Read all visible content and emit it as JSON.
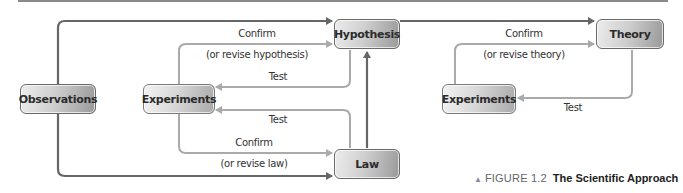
{
  "diagram": {
    "nodes": {
      "observations": "Observations",
      "experiments_left": "Experiments",
      "hypothesis": "Hypothesis",
      "law": "Law",
      "theory": "Theory",
      "experiments_right": "Experiments"
    },
    "edge_labels": {
      "confirm_hypothesis": "Confirm",
      "revise_hypothesis": "(or revise hypothesis)",
      "test_hypothesis": "Test",
      "test_law": "Test",
      "confirm_law": "Confirm",
      "revise_law": "(or revise law)",
      "confirm_theory": "Confirm",
      "revise_theory": "(or revise theory)",
      "test_theory": "Test"
    },
    "caption": {
      "marker": "▲",
      "figure_number": "FIGURE 1.2",
      "title": "The Scientific Approach"
    },
    "colors": {
      "dark_arrow": "#666666",
      "light_arrow": "#aaaaaa",
      "node_border": "#7a7a7a"
    }
  }
}
